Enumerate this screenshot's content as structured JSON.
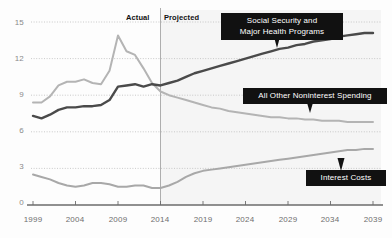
{
  "chart_data": {
    "type": "line",
    "title": "",
    "subtitle": "",
    "xlabel": "",
    "ylabel": "",
    "xlim": [
      1999,
      2039
    ],
    "ylim": [
      0,
      15
    ],
    "grid": true,
    "legend_position": "inline-callouts",
    "y_ticks": [
      "0",
      "3",
      "6",
      "9",
      "12",
      "15"
    ],
    "y_tick_values": [
      0,
      3,
      6,
      9,
      12,
      15
    ],
    "x_ticks": [
      "1999",
      "2004",
      "2009",
      "2014",
      "2019",
      "2024",
      "2029",
      "2034",
      "2039"
    ],
    "x_tick_values": [
      1999,
      2004,
      2009,
      2014,
      2019,
      2024,
      2029,
      2034,
      2039
    ],
    "divider_year": 2014,
    "annotations": [
      {
        "name": "actual",
        "text": "Actual",
        "year": 2013
      },
      {
        "name": "projected",
        "text": "Projected",
        "year": 2015
      }
    ],
    "x": [
      1999,
      2000,
      2001,
      2002,
      2003,
      2004,
      2005,
      2006,
      2007,
      2008,
      2009,
      2010,
      2011,
      2012,
      2013,
      2014,
      2015,
      2016,
      2017,
      2018,
      2019,
      2020,
      2021,
      2022,
      2023,
      2024,
      2025,
      2026,
      2027,
      2028,
      2029,
      2030,
      2031,
      2032,
      2033,
      2034,
      2035,
      2036,
      2037,
      2038,
      2039
    ],
    "series": [
      {
        "name": "Social Security and Major Health Programs",
        "color": "#4a4a4a",
        "values": [
          7.3,
          7.1,
          7.4,
          7.8,
          8.0,
          8.0,
          8.1,
          8.1,
          8.2,
          8.6,
          9.7,
          9.8,
          9.9,
          9.7,
          9.9,
          9.8,
          10.0,
          10.2,
          10.5,
          10.8,
          11.0,
          11.2,
          11.4,
          11.6,
          11.8,
          12.0,
          12.2,
          12.4,
          12.6,
          12.8,
          12.9,
          13.1,
          13.2,
          13.4,
          13.5,
          13.6,
          13.8,
          13.9,
          14.0,
          14.1,
          14.1
        ]
      },
      {
        "name": "All Other Noninterest Spending",
        "color": "#b4b4b4",
        "values": [
          8.4,
          8.4,
          8.9,
          9.8,
          10.1,
          10.1,
          10.3,
          10.0,
          9.9,
          11.0,
          13.9,
          12.6,
          12.3,
          11.2,
          10.0,
          9.3,
          9.0,
          8.8,
          8.6,
          8.4,
          8.2,
          8.0,
          7.9,
          7.7,
          7.6,
          7.5,
          7.4,
          7.3,
          7.2,
          7.2,
          7.1,
          7.1,
          7.0,
          7.0,
          6.9,
          6.9,
          6.9,
          6.8,
          6.8,
          6.8,
          6.8
        ]
      },
      {
        "name": "Interest Costs",
        "color": "#a8a8a8",
        "values": [
          2.5,
          2.3,
          2.1,
          1.8,
          1.6,
          1.5,
          1.6,
          1.8,
          1.8,
          1.7,
          1.5,
          1.5,
          1.6,
          1.6,
          1.4,
          1.4,
          1.6,
          1.9,
          2.3,
          2.6,
          2.8,
          2.9,
          3.0,
          3.1,
          3.2,
          3.3,
          3.4,
          3.5,
          3.6,
          3.7,
          3.8,
          3.9,
          4.0,
          4.1,
          4.2,
          4.3,
          4.4,
          4.5,
          4.5,
          4.6,
          4.6
        ]
      }
    ]
  },
  "callouts": {
    "social_security": "Social Security and\nMajor Health Programs",
    "all_other": "All Other Noninterest Spending",
    "interest": "Interest Costs"
  },
  "colors": {
    "dark_line": "#4a4a4a",
    "light_line": "#b4b4b4",
    "interest_line": "#a8a8a8",
    "callout_bg": "#111111",
    "callout_text": "#ffffff",
    "grid": "#bdbdbd",
    "axis": "#6b6b6b",
    "projected_bg": "#f2f2f2",
    "page_bg": "#fdfdfd"
  }
}
